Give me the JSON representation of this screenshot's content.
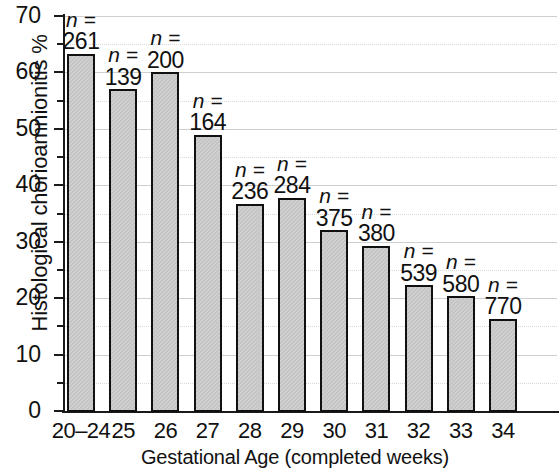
{
  "chart_data": {
    "type": "bar",
    "title": "",
    "xlabel": "Gestational Age (completed weeks)",
    "ylabel": "Histological chorioamnionitis %",
    "categories": [
      "20–24",
      "25",
      "26",
      "27",
      "28",
      "29",
      "30",
      "31",
      "32",
      "33",
      "34"
    ],
    "values": [
      63.3,
      57.0,
      60.0,
      49.0,
      36.7,
      37.8,
      32.0,
      29.3,
      22.3,
      20.3,
      16.3
    ],
    "point_labels": [
      "n =\n261",
      "n =\n139",
      "n =\n200",
      "n =\n164",
      "n =\n236",
      "n =\n284",
      "n =\n375",
      "n =\n380",
      "n =\n539",
      "n =\n580",
      "n =\n770"
    ],
    "n_prefix": "n =",
    "n_values": [
      261,
      139,
      200,
      164,
      236,
      284,
      375,
      380,
      539,
      580,
      770
    ],
    "ylim": [
      0,
      70
    ],
    "ytick_labels": [
      "0",
      "10",
      "20",
      "30",
      "40",
      "50",
      "60",
      "70"
    ],
    "ytick_values": [
      0,
      10,
      20,
      30,
      40,
      50,
      60,
      70
    ],
    "yminor_values": [
      5,
      15,
      25,
      35,
      45,
      55,
      65
    ],
    "grid": "horizontal",
    "legend": "none",
    "bar_fill_color": "#c4c4c4",
    "bar_edge_color": "#101010",
    "grid_color": "#cfcfcf"
  }
}
